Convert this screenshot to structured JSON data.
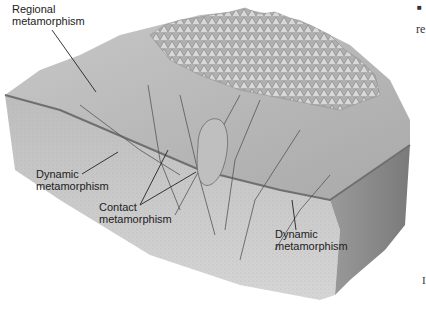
{
  "diagram": {
    "colors": {
      "background": "#ffffff",
      "block_top": "#b8b8b8",
      "block_front": "#c9c9c9",
      "block_side": "#8a8a8a",
      "mountains": "#a0a0a0",
      "leader_line": "#222222",
      "label_text": "#222222"
    },
    "labels": [
      {
        "id": "regional",
        "line1": "Regional",
        "line2": "metamorphism"
      },
      {
        "id": "dynamic-left",
        "line1": "Dynamic",
        "line2": "metamorphism"
      },
      {
        "id": "contact",
        "line1": "Contact",
        "line2": "metamorphism"
      },
      {
        "id": "dynamic-right",
        "line1": "Dynamic",
        "line2": "metamorphism"
      }
    ],
    "margin": {
      "bullet": "■",
      "fragment_top": "re",
      "fragment_bottom": "I"
    }
  }
}
